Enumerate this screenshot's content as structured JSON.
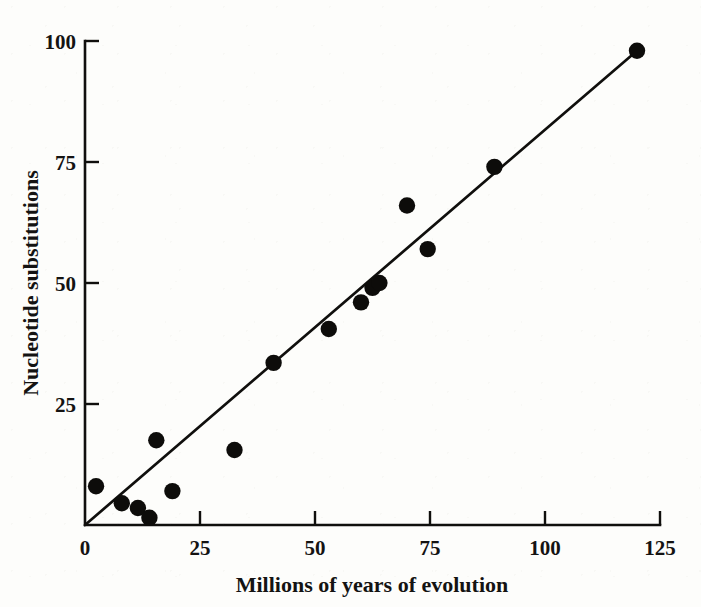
{
  "chart_data": {
    "type": "scatter",
    "title": "",
    "xlabel": "Millions of years of evolution",
    "ylabel": "Nucleotide substitutions",
    "xlim": [
      0,
      125
    ],
    "ylim": [
      0,
      100
    ],
    "xticks": [
      0,
      25,
      50,
      75,
      100,
      125
    ],
    "yticks": [
      0,
      25,
      50,
      75,
      100
    ],
    "xtick_labels": [
      "0",
      "25",
      "50",
      "75",
      "100",
      "125"
    ],
    "ytick_labels": [
      "0",
      "25",
      "50",
      "75",
      "100"
    ],
    "grid": false,
    "legend": false,
    "marker": "filled-circle",
    "marker_color": "#0d0c0a",
    "points": [
      {
        "x": 2.4,
        "y": 8
      },
      {
        "x": 8,
        "y": 4.5
      },
      {
        "x": 11.5,
        "y": 3.5
      },
      {
        "x": 14,
        "y": 1.5
      },
      {
        "x": 15.5,
        "y": 17.5
      },
      {
        "x": 19,
        "y": 7
      },
      {
        "x": 32.5,
        "y": 15.5
      },
      {
        "x": 41,
        "y": 33.5
      },
      {
        "x": 53,
        "y": 40.5
      },
      {
        "x": 60,
        "y": 46
      },
      {
        "x": 62.5,
        "y": 49
      },
      {
        "x": 64,
        "y": 50
      },
      {
        "x": 70,
        "y": 66
      },
      {
        "x": 74.5,
        "y": 57
      },
      {
        "x": 89,
        "y": 74
      },
      {
        "x": 120,
        "y": 98
      }
    ],
    "trendline": {
      "type": "linear-through-origin",
      "x_start": 0,
      "y_start": 0,
      "x_end": 120,
      "y_end": 98,
      "slope": 0.8167,
      "intercept": 0,
      "color": "#100f0d"
    }
  },
  "axes": {
    "x_title": "Millions of years of evolution",
    "y_title": "Nucleotide substitutions",
    "x_tick_labels": [
      "0",
      "25",
      "50",
      "75",
      "100",
      "125"
    ],
    "y_tick_labels": [
      "0",
      "25",
      "50",
      "75",
      "100"
    ]
  },
  "colors": {
    "ink": "#100f0d",
    "marker": "#0d0c0a",
    "background": "#fdfdfb"
  }
}
